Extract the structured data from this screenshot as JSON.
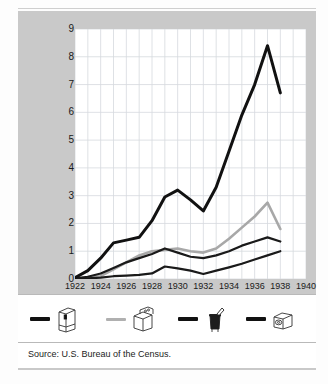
{
  "figure": {
    "source_note": "Source: U.S. Bureau of the Census.",
    "top_artifact": ""
  },
  "chart_data": {
    "type": "line",
    "title": "",
    "xlabel": "Year",
    "ylabel": "Appliances produced (in millions)",
    "xlim": [
      1922,
      1940
    ],
    "ylim": [
      0,
      9
    ],
    "xticks": [
      1922,
      1924,
      1926,
      1928,
      1930,
      1932,
      1934,
      1936,
      1938,
      1940
    ],
    "yticks": [
      0,
      1,
      2,
      3,
      4,
      5,
      6,
      7,
      8,
      9
    ],
    "xtick_labels": [
      "1922",
      "1924",
      "1926",
      "1928",
      "1930",
      "1932",
      "1934",
      "1936",
      "1938",
      "1940"
    ],
    "ytick_labels": [
      "0",
      "1",
      "2",
      "3",
      "4",
      "5",
      "6",
      "7",
      "8",
      "9"
    ],
    "grid": true,
    "grid_x_step": 1,
    "grid_y_step": 1,
    "legend_position": "below-plot",
    "x": [
      1922,
      1923,
      1924,
      1925,
      1926,
      1927,
      1928,
      1929,
      1930,
      1931,
      1932,
      1933,
      1934,
      1935,
      1936,
      1937,
      1938
    ],
    "series": [
      {
        "name": "refrigerator",
        "legend_icon": "refrigerator-icon",
        "color": "#111111",
        "width": 3.0,
        "values": [
          0.05,
          0.3,
          0.75,
          1.3,
          1.4,
          1.5,
          2.1,
          2.95,
          3.2,
          2.85,
          2.45,
          3.3,
          4.6,
          5.9,
          7.0,
          8.4,
          6.7
        ]
      },
      {
        "name": "stove-range",
        "legend_icon": "stove-icon",
        "color": "#a8a8a8",
        "width": 2.6,
        "values": [
          0.02,
          0.05,
          0.1,
          0.35,
          0.6,
          0.85,
          1.0,
          1.05,
          1.1,
          1.0,
          0.95,
          1.1,
          1.45,
          1.85,
          2.25,
          2.75,
          1.8
        ]
      },
      {
        "name": "washing-machine",
        "legend_icon": "washing-machine-icon",
        "color": "#1a1a1a",
        "width": 2.2,
        "values": [
          0.02,
          0.08,
          0.2,
          0.4,
          0.6,
          0.75,
          0.9,
          1.1,
          0.95,
          0.8,
          0.75,
          0.85,
          1.0,
          1.2,
          1.35,
          1.5,
          1.35
        ]
      },
      {
        "name": "vacuum-cleaner",
        "legend_icon": "vacuum-icon",
        "color": "#1a1a1a",
        "width": 2.2,
        "values": [
          0.0,
          0.02,
          0.05,
          0.1,
          0.12,
          0.15,
          0.2,
          0.45,
          0.38,
          0.3,
          0.18,
          0.3,
          0.42,
          0.55,
          0.7,
          0.85,
          1.0
        ]
      }
    ]
  },
  "legend": {
    "items": [
      {
        "icon": "refrigerator-icon",
        "color": "#111111",
        "thickness": 4
      },
      {
        "icon": "stove-icon",
        "color": "#b0b0b0",
        "thickness": 3
      },
      {
        "icon": "washing-machine-icon",
        "color": "#111111",
        "thickness": 4
      },
      {
        "icon": "vacuum-icon",
        "color": "#111111",
        "thickness": 4
      }
    ]
  }
}
